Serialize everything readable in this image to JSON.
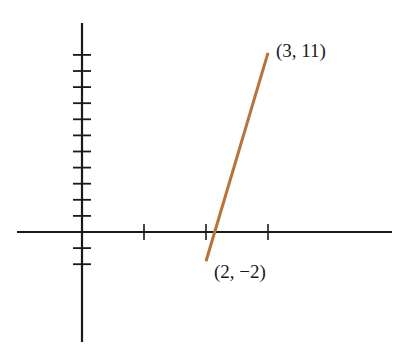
{
  "chart_data": {
    "type": "line",
    "title": "",
    "xlabel": "",
    "ylabel": "",
    "x_ticks": [
      1,
      2,
      3
    ],
    "y_ticks": [
      -2,
      -1,
      1,
      2,
      3,
      4,
      5,
      6,
      7,
      8,
      9,
      10,
      11
    ],
    "xlim": [
      -1.05,
      5.05
    ],
    "ylim": [
      -6.8,
      13.0
    ],
    "grid": false,
    "legend": null,
    "series": [
      {
        "name": "segment",
        "color": "#b8733a",
        "points": [
          {
            "x": 2,
            "y": -2,
            "label": "(2, −2)"
          },
          {
            "x": 3,
            "y": 11,
            "label": "(3, 11)"
          }
        ]
      }
    ],
    "annotations": [
      {
        "text": "(3, 11)",
        "x": 3,
        "y": 11
      },
      {
        "text": "(2, −2)",
        "x": 2,
        "y": -2
      }
    ]
  },
  "colors": {
    "axis": "#1a1a1a",
    "line": "#b8733a"
  }
}
